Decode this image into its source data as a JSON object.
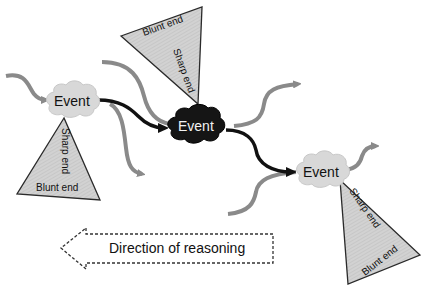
{
  "diagram": {
    "type": "event-chain",
    "colors": {
      "background": "#ffffff",
      "light_event_fill": "#d8d8d8",
      "dark_event_fill": "#151515",
      "triangle_fill": "#cfcfcf",
      "triangle_stroke": "#2a2a2a",
      "main_arrow": "#111111",
      "side_arrow": "#8a8a8a",
      "dashed_arrow": "#333333"
    },
    "events": [
      {
        "id": "event-left",
        "label": "Event",
        "style": "light"
      },
      {
        "id": "event-center",
        "label": "Event",
        "style": "dark"
      },
      {
        "id": "event-right",
        "label": "Event",
        "style": "light"
      }
    ],
    "triangles": [
      {
        "id": "triangle-left",
        "sharp_label": "Sharp end",
        "blunt_label": "Blunt end"
      },
      {
        "id": "triangle-top",
        "sharp_label": "Sharp end",
        "blunt_label": "Blunt end"
      },
      {
        "id": "triangle-right",
        "sharp_label": "Sharp end",
        "blunt_label": "Blunt end"
      }
    ],
    "direction_arrow": {
      "label": "Direction of reasoning",
      "direction": "left",
      "style": "dashed"
    },
    "edges": [
      {
        "from": "event-left",
        "to": "event-center",
        "style": "bold-black"
      },
      {
        "from": "event-center",
        "to": "event-right",
        "style": "bold-black"
      }
    ]
  }
}
